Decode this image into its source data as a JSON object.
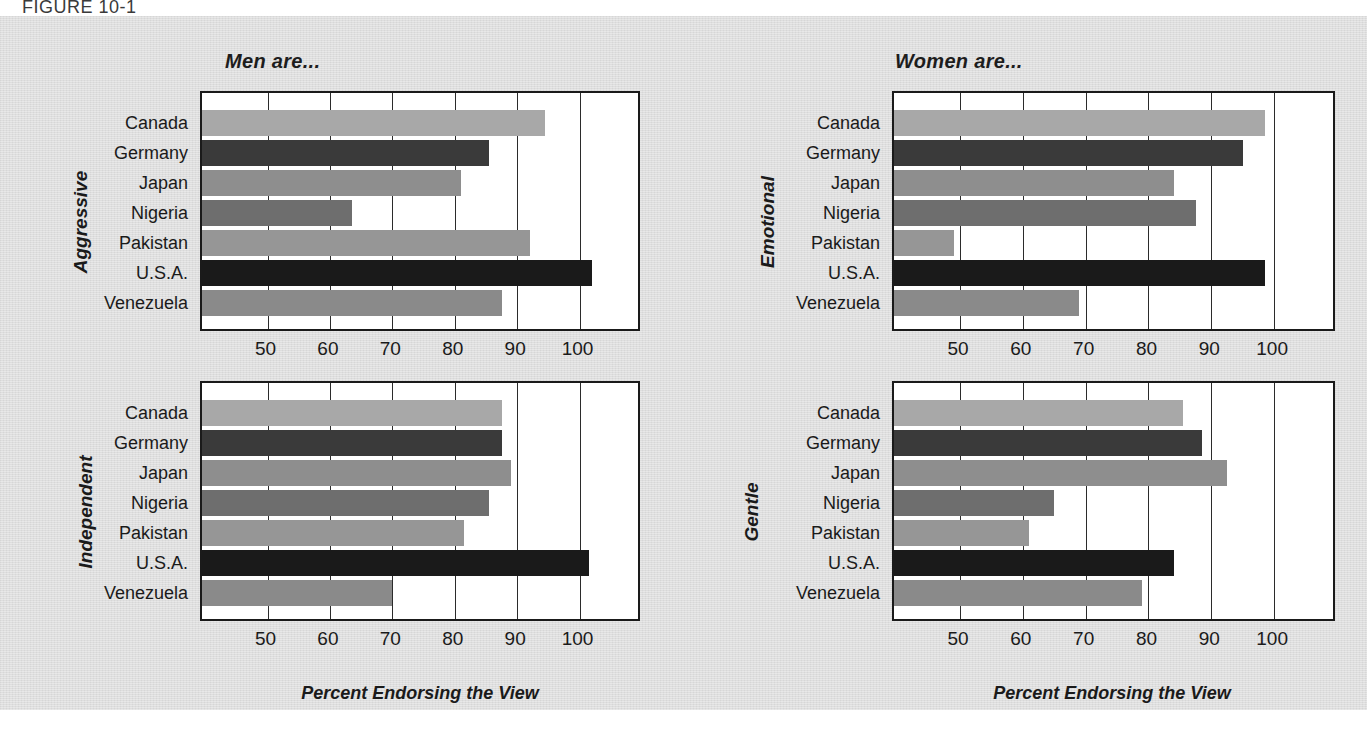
{
  "figure": {
    "label": "FIGURE 10-1",
    "panel_bg": "#dedede"
  },
  "columns": [
    {
      "title": "Men are..."
    },
    {
      "title": "Women are..."
    }
  ],
  "axis": {
    "x_title": "Percent Endorsing the View",
    "tick_labels": [
      "50",
      "60",
      "70",
      "80",
      "90",
      "100"
    ]
  },
  "series_colors": {
    "Canada": "#a8a8a8",
    "Germany": "#3a3a3a",
    "Japan": "#8e8e8e",
    "Nigeria": "#6e6e6e",
    "Pakistan": "#969696",
    "U.S.A.": "#1a1a1a",
    "Venezuela": "#8a8a8a"
  },
  "chart_data": [
    {
      "type": "bar",
      "orientation": "horizontal",
      "title": "Aggressive",
      "column": "Men are...",
      "xlabel": "Percent Endorsing the View",
      "ylabel": "Aggressive",
      "xlim": [
        39.5,
        110
      ],
      "xticks": [
        50,
        60,
        70,
        80,
        90,
        100
      ],
      "grid": true,
      "legend": "none",
      "categories": [
        "Canada",
        "Germany",
        "Japan",
        "Nigeria",
        "Pakistan",
        "U.S.A.",
        "Venezuela"
      ],
      "values": [
        94.5,
        85.5,
        81,
        63.5,
        92,
        102,
        87.5
      ]
    },
    {
      "type": "bar",
      "orientation": "horizontal",
      "title": "Independent",
      "column": "Men are...",
      "xlabel": "Percent Endorsing the View",
      "ylabel": "Independent",
      "xlim": [
        39.5,
        110
      ],
      "xticks": [
        50,
        60,
        70,
        80,
        90,
        100
      ],
      "grid": true,
      "legend": "none",
      "categories": [
        "Canada",
        "Germany",
        "Japan",
        "Nigeria",
        "Pakistan",
        "U.S.A.",
        "Venezuela"
      ],
      "values": [
        87.5,
        87.5,
        89,
        85.5,
        81.5,
        101.5,
        70
      ]
    },
    {
      "type": "bar",
      "orientation": "horizontal",
      "title": "Emotional",
      "column": "Women are...",
      "xlabel": "Percent Endorsing the View",
      "ylabel": "Emotional",
      "xlim": [
        39.5,
        110
      ],
      "xticks": [
        50,
        60,
        70,
        80,
        90,
        100
      ],
      "grid": true,
      "legend": "none",
      "categories": [
        "Canada",
        "Germany",
        "Japan",
        "Nigeria",
        "Pakistan",
        "U.S.A.",
        "Venezuela"
      ],
      "values": [
        98.5,
        95,
        84,
        87.5,
        49,
        98.5,
        69
      ]
    },
    {
      "type": "bar",
      "orientation": "horizontal",
      "title": "Gentle",
      "column": "Women are...",
      "xlabel": "Percent Endorsing the View",
      "ylabel": "Gentle",
      "xlim": [
        39.5,
        110
      ],
      "xticks": [
        50,
        60,
        70,
        80,
        90,
        100
      ],
      "grid": true,
      "legend": "none",
      "categories": [
        "Canada",
        "Germany",
        "Japan",
        "Nigeria",
        "Pakistan",
        "U.S.A.",
        "Venezuela"
      ],
      "values": [
        85.5,
        88.5,
        92.5,
        65,
        61,
        84,
        79
      ]
    }
  ]
}
